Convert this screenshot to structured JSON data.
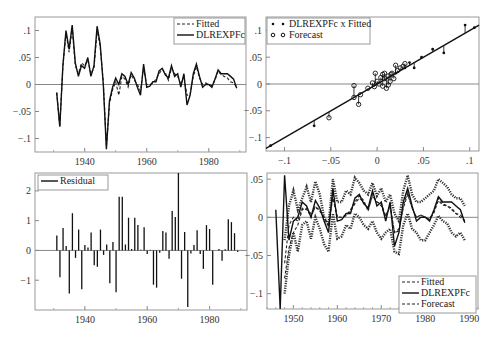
{
  "figure": {
    "panels": 4,
    "layout": "2x2"
  },
  "chart_data": [
    {
      "id": "actual-fitted",
      "type": "line",
      "title": "",
      "xlabel": "",
      "ylabel": "",
      "xlim": [
        1924,
        1992
      ],
      "ylim": [
        -0.125,
        0.125
      ],
      "x_ticks": [
        1940,
        1960,
        1980
      ],
      "y_ticks": [
        -0.1,
        -0.05,
        0,
        0.05,
        0.1
      ],
      "y_tick_labels": [
        "-.1",
        "-.05",
        "0",
        ".05",
        ".1"
      ],
      "legend": {
        "position": "top-right",
        "entries": [
          "Fitted",
          "DLREXPFc"
        ]
      },
      "x": [
        1931,
        1932,
        1933,
        1934,
        1935,
        1936,
        1937,
        1938,
        1939,
        1940,
        1941,
        1942,
        1943,
        1944,
        1945,
        1946,
        1947,
        1948,
        1949,
        1950,
        1951,
        1952,
        1953,
        1954,
        1955,
        1956,
        1957,
        1958,
        1959,
        1960,
        1961,
        1962,
        1963,
        1964,
        1965,
        1966,
        1967,
        1968,
        1969,
        1970,
        1971,
        1972,
        1973,
        1974,
        1975,
        1976,
        1977,
        1978,
        1979,
        1980,
        1981,
        1982,
        1983,
        1984,
        1985,
        1986,
        1987,
        1988,
        1989
      ],
      "series": [
        {
          "name": "DLREXPFc",
          "style": "solid",
          "values": [
            -0.015,
            -0.078,
            0.035,
            0.1,
            0.065,
            0.11,
            0.04,
            0.015,
            0.035,
            0.03,
            0.05,
            0.015,
            0.035,
            0.108,
            0.075,
            0.0,
            -0.12,
            -0.03,
            -0.005,
            0.012,
            0.0,
            0.02,
            0.015,
            0.0,
            0.022,
            0.012,
            -0.005,
            -0.02,
            0.038,
            -0.005,
            -0.003,
            0.005,
            0.005,
            0.025,
            0.03,
            0.018,
            0.012,
            0.035,
            0.015,
            0.02,
            -0.005,
            0.02,
            -0.038,
            -0.02,
            0.02,
            0.038,
            0.015,
            -0.005,
            0.0,
            0.0,
            -0.005,
            0.01,
            0.027,
            0.02,
            0.02,
            0.02,
            0.015,
            0.01,
            -0.007
          ]
        },
        {
          "name": "Fitted",
          "style": "dashed",
          "values": [
            -0.015,
            -0.078,
            0.035,
            0.095,
            0.06,
            0.105,
            0.035,
            0.02,
            0.04,
            0.035,
            0.045,
            0.02,
            0.03,
            0.1,
            0.07,
            0.005,
            -0.115,
            -0.035,
            -0.01,
            0.005,
            -0.02,
            0.015,
            0.01,
            -0.005,
            0.018,
            0.008,
            0.0,
            -0.012,
            0.03,
            0.0,
            0.0,
            0.002,
            0.01,
            0.02,
            0.028,
            0.022,
            0.008,
            0.03,
            0.02,
            0.015,
            0.0,
            0.015,
            -0.02,
            -0.018,
            0.015,
            0.033,
            0.012,
            0.0,
            0.003,
            0.0,
            -0.002,
            0.008,
            0.025,
            0.018,
            0.015,
            0.012,
            0.005,
            0.003,
            -0.005
          ]
        }
      ]
    },
    {
      "id": "cross-plot",
      "type": "scatter",
      "title": "",
      "xlabel": "",
      "ylabel": "",
      "xlim": [
        -0.12,
        0.11
      ],
      "ylim": [
        -0.125,
        0.125
      ],
      "x_ticks": [
        -0.1,
        -0.05,
        0,
        0.05,
        0.1
      ],
      "x_tick_labels": [
        "-.1",
        "-.05",
        "0",
        ".05",
        ".1"
      ],
      "y_ticks": [
        -0.1,
        -0.05,
        0,
        0.05,
        0.1
      ],
      "y_tick_labels": [
        "-.1",
        "-.05",
        "0",
        ".05",
        ".1"
      ],
      "legend": {
        "position": "top-left",
        "entries": [
          "DLREXPFc x Fitted",
          "Forecast"
        ]
      },
      "fit_line": {
        "x": [
          -0.12,
          0.11
        ],
        "y": [
          -0.12,
          0.11
        ]
      },
      "series": [
        {
          "name": "DLREXPFc x Fitted",
          "marker": "dot",
          "points": [
            [
              -0.115,
              -0.115
            ],
            [
              -0.068,
              -0.078
            ],
            [
              0.048,
              0.05
            ],
            [
              0.06,
              0.065
            ],
            [
              0.072,
              0.058
            ],
            [
              0.095,
              0.11
            ],
            [
              0.105,
              0.105
            ],
            [
              0.04,
              0.03
            ],
            [
              0.02,
              0.02
            ],
            [
              0.03,
              0.03
            ],
            [
              0.035,
              0.04
            ]
          ]
        },
        {
          "name": "Forecast",
          "marker": "circle",
          "points": [
            [
              -0.052,
              -0.063
            ],
            [
              -0.025,
              -0.003
            ],
            [
              -0.025,
              -0.025
            ],
            [
              -0.02,
              -0.038
            ],
            [
              -0.018,
              -0.02
            ],
            [
              -0.01,
              -0.008
            ],
            [
              -0.005,
              0.002
            ],
            [
              -0.003,
              -0.005
            ],
            [
              -0.002,
              0.02
            ],
            [
              0.0,
              0.005
            ],
            [
              0.002,
              0.0
            ],
            [
              0.004,
              0.012
            ],
            [
              0.006,
              0.018
            ],
            [
              0.008,
              0.01
            ],
            [
              0.01,
              -0.008
            ],
            [
              0.012,
              0.015
            ],
            [
              0.014,
              0.005
            ],
            [
              0.016,
              0.02
            ],
            [
              0.018,
              0.01
            ],
            [
              0.02,
              0.035
            ],
            [
              0.022,
              0.025
            ],
            [
              0.025,
              0.03
            ],
            [
              0.028,
              0.033
            ],
            [
              0.03,
              0.038
            ],
            [
              0.012,
              -0.002
            ],
            [
              0.008,
              0.02
            ],
            [
              0.015,
              0.018
            ],
            [
              0.006,
              -0.004
            ]
          ]
        }
      ]
    },
    {
      "id": "residuals",
      "type": "bar",
      "title": "",
      "xlabel": "",
      "ylabel": "",
      "xlim": [
        1924,
        1992
      ],
      "ylim": [
        -2.0,
        2.6
      ],
      "x_ticks": [
        1940,
        1960,
        1980
      ],
      "y_ticks": [
        -1,
        0,
        1,
        2
      ],
      "y_tick_labels": [
        "-1",
        "0",
        "1",
        "2"
      ],
      "legend": {
        "position": "top-left",
        "entries": [
          "Residual"
        ]
      },
      "x": [
        1931,
        1932,
        1933,
        1934,
        1935,
        1936,
        1937,
        1938,
        1939,
        1940,
        1941,
        1942,
        1943,
        1944,
        1945,
        1946,
        1947,
        1948,
        1949,
        1950,
        1951,
        1952,
        1953,
        1954,
        1955,
        1956,
        1957,
        1958,
        1959,
        1960,
        1961,
        1962,
        1963,
        1964,
        1965,
        1966,
        1967,
        1968,
        1969,
        1970,
        1971,
        1972,
        1973,
        1974,
        1975,
        1976,
        1977,
        1978,
        1979,
        1980,
        1981,
        1982,
        1983,
        1984,
        1985,
        1986,
        1987,
        1988,
        1989
      ],
      "series": [
        {
          "name": "Residual",
          "values": [
            0.5,
            -0.9,
            0.75,
            0.15,
            -1.45,
            1.25,
            -0.25,
            0.7,
            -1.3,
            0.18,
            0.1,
            0.6,
            -0.5,
            -0.55,
            0.7,
            -0.15,
            0.2,
            -1.1,
            0.28,
            -1.4,
            1.8,
            1.8,
            0.2,
            1.1,
            0.05,
            1.1,
            0.85,
            0.02,
            0.78,
            -0.12,
            0.02,
            -1.15,
            -1.25,
            -0.08,
            0.65,
            0.6,
            -0.28,
            1.32,
            1.12,
            2.6,
            -0.95,
            0.62,
            -1.9,
            -0.1,
            0.18,
            0.68,
            -0.12,
            -0.62,
            0.85,
            0.72,
            -1.15,
            0.0,
            0.05,
            -0.35,
            0.04,
            1.05,
            0.95,
            0.58,
            -0.05
          ]
        }
      ]
    },
    {
      "id": "forecast",
      "type": "line",
      "title": "",
      "xlabel": "",
      "ylabel": "",
      "xlim": [
        1944,
        1992
      ],
      "ylim": [
        -0.12,
        0.058
      ],
      "x_ticks": [
        1950,
        1960,
        1970,
        1980,
        1990
      ],
      "y_ticks": [
        -0.1,
        -0.05,
        0,
        0.05
      ],
      "y_tick_labels": [
        "-.1",
        "-.05",
        "0",
        ".05"
      ],
      "legend": {
        "position": "bottom-right",
        "entries": [
          "Fitted",
          "DLREXPFc",
          "Forecast"
        ]
      },
      "x": [
        1946,
        1947,
        1948,
        1949,
        1950,
        1951,
        1952,
        1953,
        1954,
        1955,
        1956,
        1957,
        1958,
        1959,
        1960,
        1961,
        1962,
        1963,
        1964,
        1965,
        1966,
        1967,
        1968,
        1969,
        1970,
        1971,
        1972,
        1973,
        1974,
        1975,
        1976,
        1977,
        1978,
        1979,
        1980,
        1981,
        1982,
        1983,
        1984,
        1985,
        1986,
        1987,
        1988,
        1989
      ],
      "series": [
        {
          "name": "DLREXPFc",
          "style": "solid",
          "values": [
            0.01,
            -0.12,
            0.055,
            -0.03,
            -0.005,
            0.0,
            0.02,
            0.015,
            0.0,
            0.022,
            0.012,
            -0.005,
            -0.02,
            0.038,
            -0.005,
            -0.003,
            0.005,
            0.005,
            0.025,
            0.03,
            0.018,
            0.012,
            0.035,
            0.015,
            0.02,
            -0.005,
            0.02,
            -0.038,
            -0.02,
            0.02,
            0.038,
            0.015,
            -0.005,
            0.0,
            0.0,
            -0.005,
            0.01,
            0.027,
            0.02,
            0.02,
            0.02,
            0.015,
            0.01,
            -0.007
          ]
        },
        {
          "name": "Fitted",
          "style": "dashed",
          "values": [
            null,
            null,
            -0.08,
            -0.04,
            -0.02,
            -0.01,
            0.01,
            0.012,
            0.0,
            0.015,
            0.008,
            0.0,
            -0.012,
            0.03,
            0.0,
            0.0,
            0.002,
            0.01,
            0.02,
            0.028,
            0.022,
            0.008,
            0.03,
            0.02,
            0.015,
            0.0,
            0.015,
            -0.02,
            -0.018,
            0.015,
            0.033,
            0.012,
            0.0,
            0.003,
            0.0,
            -0.002,
            0.008,
            0.025,
            0.018,
            0.015,
            0.012,
            0.005,
            0.003,
            -0.005
          ]
        },
        {
          "name": "Forecast",
          "style": "dashed",
          "values": [
            null,
            null,
            -0.06,
            -0.01,
            0.0,
            -0.005,
            0.012,
            0.01,
            0.005,
            0.012,
            0.01,
            0.0,
            -0.01,
            0.025,
            0.0,
            0.0,
            0.003,
            0.008,
            0.018,
            0.025,
            0.02,
            0.01,
            0.028,
            0.02,
            0.018,
            0.002,
            0.015,
            -0.02,
            -0.015,
            0.012,
            0.03,
            0.012,
            0.0,
            0.003,
            0.0,
            -0.003,
            0.006,
            0.022,
            0.016,
            0.015,
            0.01,
            0.005,
            0.0,
            -0.005
          ]
        },
        {
          "name": "Forecast upper band",
          "style": "dotted-thick",
          "values": [
            null,
            null,
            -0.03,
            0.015,
            0.035,
            0.01,
            0.025,
            0.04,
            0.02,
            0.047,
            0.03,
            0.0,
            -0.01,
            0.05,
            0.02,
            0.02,
            0.035,
            0.03,
            0.052,
            0.045,
            0.035,
            0.03,
            0.045,
            0.028,
            0.038,
            0.02,
            0.03,
            0.005,
            -0.005,
            0.035,
            0.055,
            0.03,
            0.02,
            0.02,
            0.025,
            0.03,
            0.035,
            0.05,
            0.045,
            0.04,
            0.03,
            0.025,
            0.025,
            0.015
          ]
        },
        {
          "name": "Forecast lower band",
          "style": "dotted-thick",
          "values": [
            null,
            null,
            -0.1,
            -0.05,
            -0.02,
            -0.045,
            -0.01,
            -0.005,
            -0.028,
            0.0,
            -0.015,
            -0.035,
            -0.045,
            0.005,
            -0.028,
            -0.025,
            -0.01,
            -0.015,
            0.005,
            0.0,
            -0.01,
            -0.015,
            -0.005,
            -0.02,
            -0.028,
            -0.02,
            -0.015,
            -0.045,
            -0.048,
            -0.01,
            0.005,
            -0.015,
            -0.02,
            -0.03,
            -0.03,
            -0.02,
            -0.01,
            0.002,
            -0.005,
            -0.008,
            -0.02,
            -0.025,
            -0.02,
            -0.03
          ]
        }
      ]
    }
  ]
}
